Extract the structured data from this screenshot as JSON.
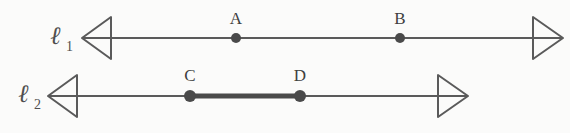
{
  "figure": {
    "background_color": "#fbfbfa",
    "stroke_color": "#5a5a5a",
    "label_color": "#4f4f4f",
    "point_color": "#4a4a4a"
  },
  "lines": [
    {
      "id": "l1",
      "label": "ℓ",
      "subscript": "1",
      "label_x": 50,
      "label_y": 44,
      "subscript_x": 66,
      "subscript_y": 51,
      "y": 38,
      "left_arrow_tip_x": 82,
      "left_arrow_base_x": 111,
      "right_arrow_base_x": 533,
      "right_arrow_tip_x": 563,
      "arrow_half_height": 21,
      "stroke_width": 2,
      "segment": null,
      "points": [
        {
          "name": "A",
          "x": 236,
          "label_x": 236,
          "label_y": 24,
          "radius": 5
        },
        {
          "name": "B",
          "x": 400,
          "label_x": 400,
          "label_y": 24,
          "radius": 5
        }
      ]
    },
    {
      "id": "l2",
      "label": "ℓ",
      "subscript": "2",
      "label_x": 18,
      "label_y": 102,
      "subscript_x": 34,
      "subscript_y": 109,
      "y": 96,
      "left_arrow_tip_x": 48,
      "left_arrow_base_x": 77,
      "right_arrow_base_x": 438,
      "right_arrow_tip_x": 468,
      "arrow_half_height": 21,
      "stroke_width": 2,
      "segment": {
        "from": "C",
        "to": "D",
        "x1": 190,
        "x2": 300,
        "stroke_width": 5
      },
      "points": [
        {
          "name": "C",
          "x": 190,
          "label_x": 190,
          "label_y": 81,
          "radius": 6
        },
        {
          "name": "D",
          "x": 300,
          "label_x": 300,
          "label_y": 81,
          "radius": 6
        }
      ]
    }
  ]
}
